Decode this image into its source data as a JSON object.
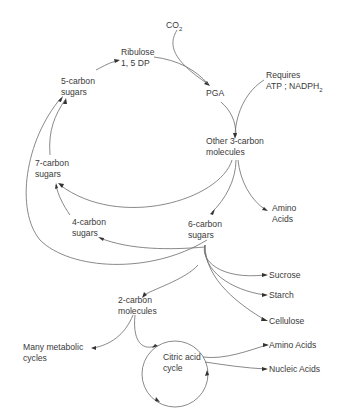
{
  "diagram": {
    "nodes": {
      "co2": {
        "label": "CO",
        "sub": "2"
      },
      "ribulose": {
        "line1": "Ribulose",
        "line2": "1, 5 DP"
      },
      "pga": {
        "label": "PGA"
      },
      "requires": {
        "line1": "Requires",
        "line2a": "ATP ; NADPH",
        "sub": "2"
      },
      "five_carbon": {
        "line1": "5-carbon",
        "line2": "sugars"
      },
      "other_three_carbon": {
        "line1": "Other 3-carbon",
        "line2": "molecules"
      },
      "seven_carbon": {
        "line1": "7-carbon",
        "line2": "sugars"
      },
      "amino_acids_1": {
        "line1": "Amino",
        "line2": "Acids"
      },
      "four_carbon": {
        "line1": "4-carbon",
        "line2": "sugars"
      },
      "six_carbon": {
        "line1": "6-carbon",
        "line2": "sugars"
      },
      "sucrose": {
        "label": "Sucrose"
      },
      "starch": {
        "label": "Starch"
      },
      "cellulose": {
        "label": "Cellulose"
      },
      "two_carbon": {
        "line1": "2-carbon",
        "line2": "molecules"
      },
      "many_metabolic": {
        "line1": "Many metabolic",
        "line2": "cycles"
      },
      "citric_acid": {
        "line1": "Citric acid",
        "line2": "cycle"
      },
      "amino_acids_2": {
        "label": "Amino Acids"
      },
      "nucleic_acids": {
        "label": "Nucleic Acids"
      }
    },
    "edges": [
      [
        "CO2",
        "PGA"
      ],
      [
        "Ribulose 1,5 DP",
        "PGA"
      ],
      [
        "PGA",
        "Other 3-carbon molecules"
      ],
      [
        "Requires ATP; NADPH2",
        "Other 3-carbon molecules"
      ],
      [
        "Other 3-carbon molecules",
        "7-carbon sugars"
      ],
      [
        "Other 3-carbon molecules",
        "6-carbon sugars"
      ],
      [
        "Other 3-carbon molecules",
        "Amino Acids"
      ],
      [
        "7-carbon sugars",
        "5-carbon sugars"
      ],
      [
        "6-carbon sugars",
        "5-carbon sugars"
      ],
      [
        "5-carbon sugars",
        "Ribulose 1,5 DP"
      ],
      [
        "6-carbon sugars",
        "4-carbon sugars"
      ],
      [
        "4-carbon sugars",
        "7-carbon sugars"
      ],
      [
        "6-carbon sugars",
        "Sucrose"
      ],
      [
        "6-carbon sugars",
        "Starch"
      ],
      [
        "6-carbon sugars",
        "Cellulose"
      ],
      [
        "6-carbon sugars",
        "2-carbon molecules"
      ],
      [
        "2-carbon molecules",
        "Many metabolic cycles"
      ],
      [
        "2-carbon molecules",
        "Citric acid cycle"
      ],
      [
        "Citric acid cycle",
        "Amino Acids"
      ],
      [
        "Citric acid cycle",
        "Nucleic Acids"
      ]
    ]
  }
}
